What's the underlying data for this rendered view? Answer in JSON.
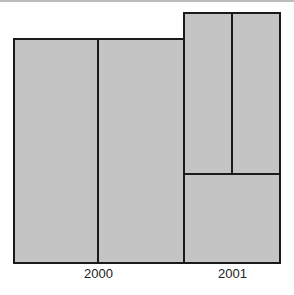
{
  "diagram": {
    "type": "mosaic",
    "fill_color": "#c4c4c4",
    "border_color": "#1a1a1a",
    "groups": [
      {
        "label": "2000",
        "cells": 2,
        "layout": "two equal vertical cells"
      },
      {
        "label": "2001",
        "cells": 3,
        "layout": "two vertical cells on top, one wide cell below"
      }
    ]
  },
  "labels": {
    "year_2000": "2000",
    "year_2001": "2001"
  }
}
